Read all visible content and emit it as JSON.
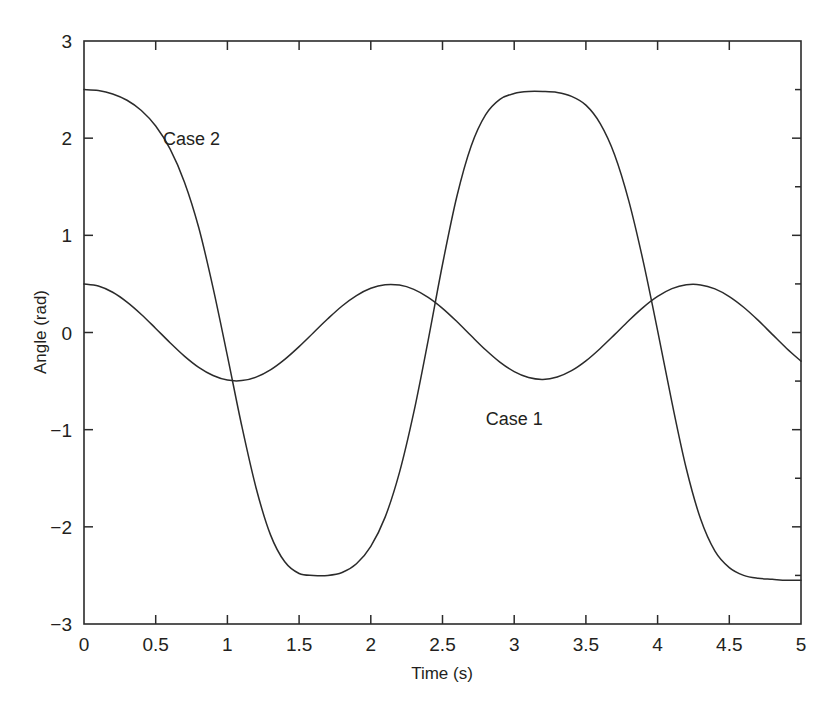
{
  "chart_data": {
    "type": "line",
    "title": "",
    "xlabel": "Time (s)",
    "ylabel": "Angle (rad)",
    "xlim": [
      0,
      5
    ],
    "ylim": [
      -3,
      3
    ],
    "xticks": [
      0,
      0.5,
      1,
      1.5,
      2,
      2.5,
      3,
      3.5,
      4,
      4.5,
      5
    ],
    "xticklabels": [
      "0",
      "0.5",
      "1",
      "1.5",
      "2",
      "2.5",
      "3",
      "3.5",
      "4",
      "4.5",
      "5"
    ],
    "yticks": [
      -3,
      -2,
      -1,
      0,
      1,
      2,
      3
    ],
    "yticklabels": [
      "−3",
      "−2",
      "−1",
      "0",
      "1",
      "2",
      "3"
    ],
    "grid": false,
    "legend": "inline-annotation",
    "frame": "box",
    "tick_direction": "in",
    "line_color": "#2b2b2b",
    "series": [
      {
        "name": "Case 1",
        "annotation": "Case 1",
        "annotation_x": 3.0,
        "annotation_y": -0.95,
        "amplitude": 0.5,
        "period": 2.05,
        "x": [
          0,
          0.1,
          0.2,
          0.3,
          0.4,
          0.5,
          0.6,
          0.7,
          0.8,
          0.9,
          1.0,
          1.1,
          1.2,
          1.3,
          1.4,
          1.5,
          1.6,
          1.7,
          1.8,
          1.9,
          2.0,
          2.1,
          2.2,
          2.3,
          2.4,
          2.5,
          2.6,
          2.7,
          2.8,
          2.9,
          3.0,
          3.1,
          3.2,
          3.3,
          3.4,
          3.5,
          3.6,
          3.7,
          3.8,
          3.9,
          4.0,
          4.1,
          4.2,
          4.3,
          4.4,
          4.5,
          4.6,
          4.7,
          4.8,
          4.9,
          5.0
        ],
        "values": [
          0.5,
          0.478,
          0.414,
          0.313,
          0.186,
          0.042,
          -0.105,
          -0.243,
          -0.359,
          -0.443,
          -0.49,
          -0.495,
          -0.459,
          -0.384,
          -0.276,
          -0.145,
          -0.002,
          0.141,
          0.273,
          0.38,
          0.455,
          0.492,
          0.488,
          0.444,
          0.362,
          0.249,
          0.113,
          -0.034,
          -0.178,
          -0.305,
          -0.403,
          -0.464,
          -0.483,
          -0.458,
          -0.393,
          -0.292,
          -0.164,
          -0.022,
          0.124,
          0.259,
          0.371,
          0.451,
          0.491,
          0.49,
          0.449,
          0.37,
          0.26,
          0.127,
          -0.019,
          -0.164,
          -0.295
        ]
      },
      {
        "name": "Case 2",
        "annotation": "Case 2",
        "annotation_x": 0.75,
        "annotation_y": 1.93,
        "amplitude": 2.5,
        "period": 3.3,
        "x": [
          0,
          0.1,
          0.2,
          0.3,
          0.4,
          0.5,
          0.6,
          0.7,
          0.8,
          0.9,
          1.0,
          1.1,
          1.2,
          1.3,
          1.4,
          1.5,
          1.6,
          1.7,
          1.8,
          1.9,
          2.0,
          2.1,
          2.2,
          2.3,
          2.4,
          2.5,
          2.6,
          2.7,
          2.8,
          2.9,
          3.0,
          3.1,
          3.2,
          3.3,
          3.4,
          3.5,
          3.6,
          3.7,
          3.8,
          3.9,
          4.0,
          4.1,
          4.2,
          4.3,
          4.4,
          4.5,
          4.6,
          4.7,
          4.8,
          4.9,
          5.0
        ],
        "values": [
          2.5,
          2.49,
          2.455,
          2.39,
          2.285,
          2.125,
          1.89,
          1.55,
          1.08,
          0.46,
          -0.24,
          -0.96,
          -1.6,
          -2.08,
          -2.36,
          -2.48,
          -2.5,
          -2.5,
          -2.47,
          -2.38,
          -2.2,
          -1.9,
          -1.44,
          -0.82,
          -0.08,
          0.7,
          1.4,
          1.92,
          2.24,
          2.4,
          2.46,
          2.48,
          2.48,
          2.47,
          2.43,
          2.34,
          2.15,
          1.83,
          1.35,
          0.73,
          0.02,
          -0.72,
          -1.4,
          -1.92,
          -2.25,
          -2.42,
          -2.5,
          -2.53,
          -2.54,
          -2.55,
          -2.55
        ]
      }
    ]
  },
  "figure": {
    "caption": ""
  }
}
